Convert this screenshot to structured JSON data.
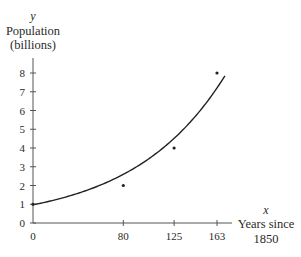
{
  "chart_data": {
    "type": "scatter",
    "title": "",
    "xlabel": "Years since 1850",
    "xlabel_lines": [
      "Years since",
      "1850"
    ],
    "xvar": "x",
    "ylabel": "Population (billions)",
    "ylabel_lines": [
      "Population",
      "(billions)"
    ],
    "yvar": "y",
    "xlim": [
      0,
      170
    ],
    "ylim": [
      0,
      8.8
    ],
    "xticks": [
      0,
      80,
      125,
      163
    ],
    "yticks": [
      0,
      1,
      2,
      3,
      4,
      5,
      6,
      7,
      8
    ],
    "grid": false,
    "legend": "none",
    "series": [
      {
        "name": "Data",
        "kind": "points",
        "x": [
          0,
          80,
          125,
          163
        ],
        "y": [
          1,
          2,
          4,
          8
        ]
      },
      {
        "name": "Exponential fit",
        "kind": "curve",
        "model": "y = a*exp(k*x)",
        "a": 0.97,
        "k": 0.0123,
        "x_range": [
          0,
          170
        ]
      }
    ],
    "colors": {
      "ink": "#2a2a2a",
      "axis": "#555555"
    }
  }
}
